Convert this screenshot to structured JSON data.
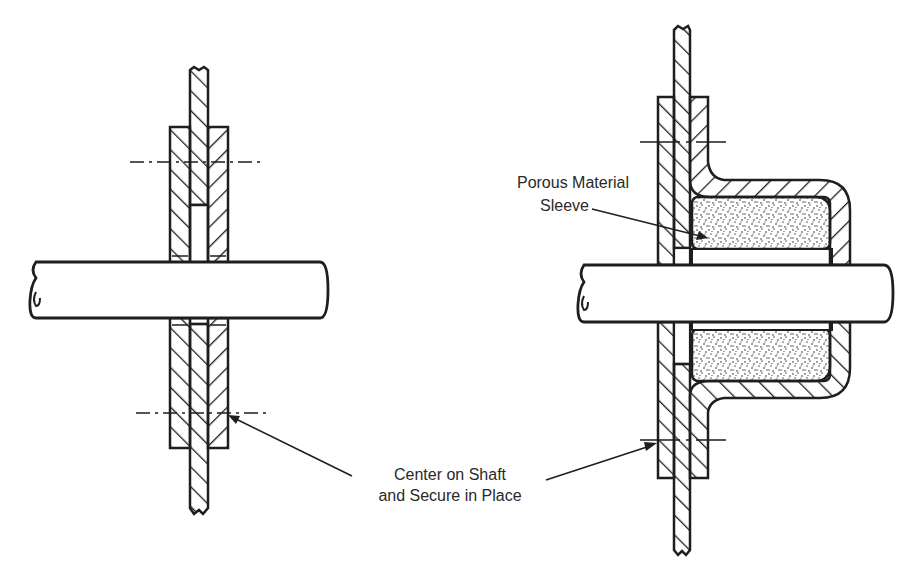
{
  "figure": {
    "colors": {
      "ink": "#1e1e1e",
      "background": "#ffffff",
      "stipple": "#2a2a2a"
    }
  },
  "labels": {
    "porous_line1": "Porous Material",
    "porous_line2": "Sleeve",
    "center_line1": "Center on Shaft",
    "center_line2": "and Secure in Place"
  },
  "views": [
    {
      "name": "left-assembly",
      "components": [
        "plate",
        "collar-left",
        "collar-right",
        "shaft",
        "center-line-top",
        "center-line-bottom"
      ]
    },
    {
      "name": "right-assembly",
      "components": [
        "plate",
        "collar-left",
        "housing",
        "porous-sleeve",
        "shaft",
        "center-line-top",
        "center-line-bottom"
      ]
    }
  ]
}
